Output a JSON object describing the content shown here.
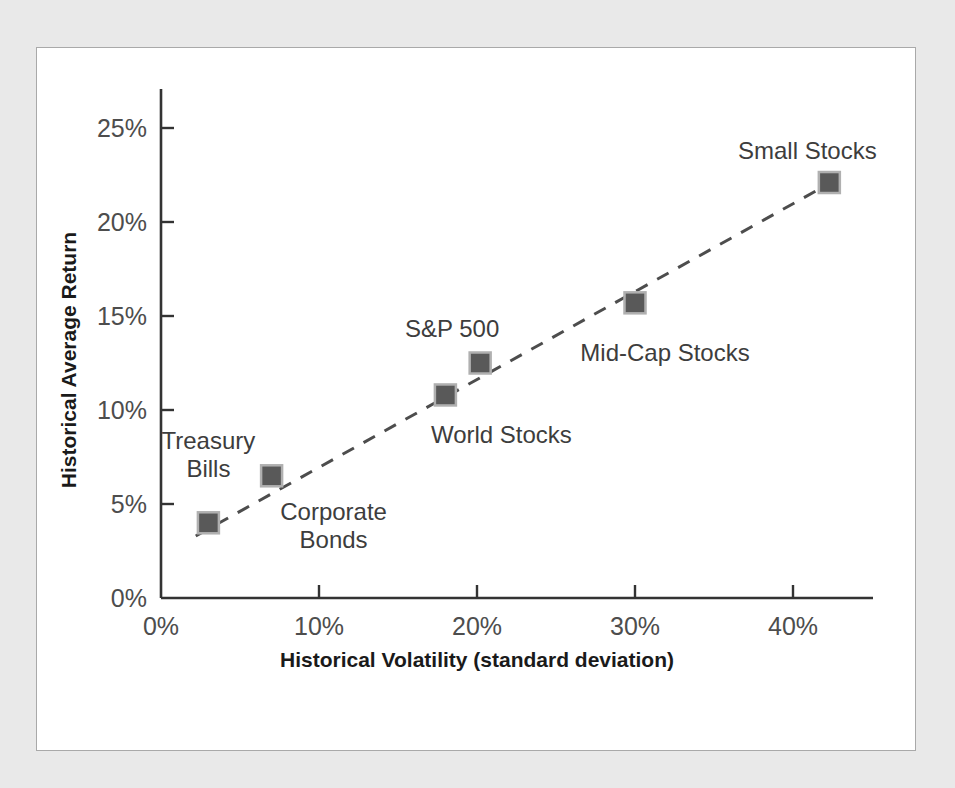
{
  "figure": {
    "background_color": "#e9e9e9",
    "panel_color": "#ffffff",
    "panel_border_color": "#a9a9a9"
  },
  "chart_data": {
    "type": "scatter",
    "title": "",
    "xlabel": "Historical Volatility (standard deviation)",
    "ylabel": "Historical Average Return",
    "xlim": [
      0,
      45
    ],
    "ylim": [
      0,
      26.5
    ],
    "xticks": [
      "0%",
      "10%",
      "20%",
      "30%",
      "40%"
    ],
    "xtick_values": [
      0,
      10,
      20,
      30,
      40
    ],
    "yticks": [
      "0%",
      "5%",
      "10%",
      "15%",
      "20%",
      "25%"
    ],
    "ytick_values": [
      0,
      5,
      10,
      15,
      20,
      25
    ],
    "grid": false,
    "legend": "none",
    "marker_color": "#595959",
    "marker_edge_color": "#b0b0b0",
    "trendline_style": "dashed",
    "trendline_color": "#4d4d4d",
    "points": [
      {
        "name": "Treasury Bills",
        "x": 3.0,
        "y": 4.0,
        "label": "Treasury\nBills",
        "label_dx": 0,
        "label_dy": -96,
        "align": "center"
      },
      {
        "name": "Corporate Bonds",
        "x": 7.0,
        "y": 6.5,
        "label": "Corporate\nBonds",
        "label_dx": 62,
        "label_dy": 22,
        "align": "center"
      },
      {
        "name": "World Stocks",
        "x": 18.0,
        "y": 10.8,
        "label": "World Stocks",
        "label_dx": 56,
        "label_dy": 26,
        "align": "center"
      },
      {
        "name": "S&P 500",
        "x": 20.2,
        "y": 12.5,
        "label": "S&P 500",
        "label_dx": -28,
        "label_dy": -48,
        "align": "center"
      },
      {
        "name": "Mid-Cap Stocks",
        "x": 30.0,
        "y": 15.7,
        "label": "Mid-Cap Stocks",
        "label_dx": 30,
        "label_dy": 36,
        "align": "center"
      },
      {
        "name": "Small Stocks",
        "x": 42.3,
        "y": 22.1,
        "label": "Small Stocks",
        "label_dx": -22,
        "label_dy": -46,
        "align": "center"
      }
    ],
    "trendline": {
      "x0": 2.2,
      "y0": 3.3,
      "x1": 42.2,
      "y1": 22.0
    }
  }
}
